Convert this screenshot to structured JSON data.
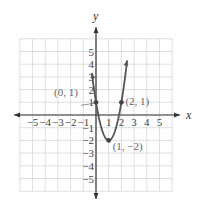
{
  "chart_data": {
    "type": "line",
    "title": "",
    "xlabel": "x",
    "ylabel": "y",
    "xlim": [
      -6,
      6
    ],
    "ylim": [
      -6,
      6
    ],
    "grid": true,
    "x_ticks": [
      -5,
      -4,
      -3,
      -2,
      -1,
      1,
      2,
      3,
      4,
      5
    ],
    "y_ticks": [
      -5,
      -4,
      -3,
      -2,
      -1,
      1,
      2,
      3,
      4,
      5
    ],
    "series": [
      {
        "name": "parabola",
        "equation": "y = 3(x-1)^2 - 2",
        "color": "#555555",
        "x_range": [
          -0.33,
          2.45
        ],
        "sample_points": [
          {
            "x": -0.29,
            "y": 5.0
          },
          {
            "x": 0,
            "y": 1
          },
          {
            "x": 1,
            "y": -2
          },
          {
            "x": 2,
            "y": 1
          },
          {
            "x": 2.29,
            "y": 5.0
          }
        ]
      }
    ],
    "annotations": [
      {
        "label": "(0, 1)",
        "x": 0,
        "y": 1
      },
      {
        "label": "(2, 1)",
        "x": 2,
        "y": 1
      },
      {
        "label": "(1, −2)",
        "x": 1,
        "y": -2
      }
    ]
  }
}
